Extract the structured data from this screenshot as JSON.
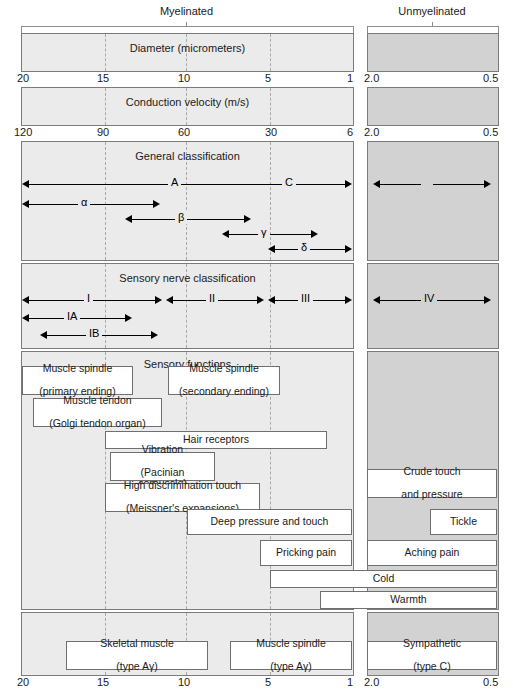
{
  "header": {
    "myelinated": "Myelinated",
    "unmyelinated": "Unmyelinated"
  },
  "bands": {
    "diameter_title": "Diameter (micrometers)",
    "velocity_title": "Conduction velocity (m/s)",
    "general_title": "General classification",
    "sensory_class_title": "Sensory nerve classification",
    "sensory_func_title": "Sensory functions"
  },
  "axes": {
    "diameter_myelinated": [
      "20",
      "15",
      "10",
      "5",
      "1"
    ],
    "diameter_unmyelinated": [
      "2.0",
      "0.5"
    ],
    "velocity_myelinated": [
      "120",
      "90",
      "60",
      "30",
      "6"
    ],
    "velocity_unmyelinated": [
      "2.0",
      "0.5"
    ],
    "bottom_myelinated": [
      "20",
      "15",
      "10",
      "5",
      "1"
    ],
    "bottom_unmyelinated": [
      "2.0",
      "0.5"
    ]
  },
  "general_classification": {
    "arrows": [
      {
        "label": "A",
        "row": 0,
        "side": "myelinated"
      },
      {
        "label": "C",
        "row": 0,
        "side": "unmyelinated"
      },
      {
        "label": "α",
        "row": 1,
        "side": "myelinated"
      },
      {
        "label": "β",
        "row": 2,
        "side": "myelinated"
      },
      {
        "label": "γ",
        "row": 3,
        "side": "myelinated"
      },
      {
        "label": "δ",
        "row": 4,
        "side": "myelinated"
      }
    ]
  },
  "sensory_classification": {
    "arrows": [
      {
        "label": "I"
      },
      {
        "label": "II"
      },
      {
        "label": "III"
      },
      {
        "label": "IV"
      },
      {
        "label": "IA"
      },
      {
        "label": "IB"
      }
    ]
  },
  "sensory_functions": {
    "boxes": [
      {
        "line1": "Muscle spindle",
        "line2": "(primary ending)"
      },
      {
        "line1": "Muscle spindle",
        "line2": "(secondary ending)"
      },
      {
        "line1": "Muscle tendon",
        "line2": "(Golgi tendon organ)"
      },
      {
        "line1": "Hair receptors",
        "line2": ""
      },
      {
        "line1": "Vibration",
        "line2": "(Pacinian corpuscle)"
      },
      {
        "line1": "High discrimination touch",
        "line2": "(Meissner's expansions)"
      },
      {
        "line1": "Crude touch",
        "line2": "and pressure"
      },
      {
        "line1": "Deep pressure and touch",
        "line2": ""
      },
      {
        "line1": "Tickle",
        "line2": ""
      },
      {
        "line1": "Pricking pain",
        "line2": ""
      },
      {
        "line1": "Aching pain",
        "line2": ""
      },
      {
        "line1": "Cold",
        "line2": ""
      },
      {
        "line1": "Warmth",
        "line2": ""
      }
    ]
  },
  "motor_functions": {
    "boxes": [
      {
        "line1": "Skeletal muscle",
        "line2": "(type Aγ)"
      },
      {
        "line1": "Muscle spindle",
        "line2": "(type Aγ)"
      },
      {
        "line1": "Sympathetic",
        "line2": "(type C)"
      }
    ]
  }
}
